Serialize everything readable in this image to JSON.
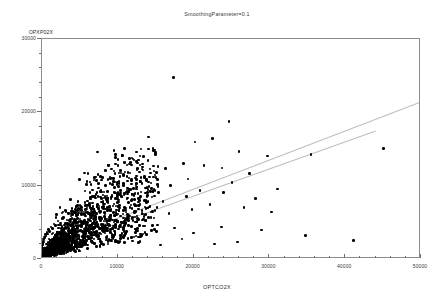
{
  "chart_data": {
    "type": "scatter",
    "title": "SmoothingParameter=0.1",
    "xlabel": "OPTCO2X",
    "ylabel": "OPXP02X",
    "xlim": [
      0,
      50000
    ],
    "ylim": [
      0,
      30000
    ],
    "xticks": [
      0,
      10000,
      20000,
      30000,
      40000,
      50000
    ],
    "xtick_labels": [
      "0",
      "10000",
      "20000",
      "30000",
      "40000",
      "50000"
    ],
    "yticks": [
      0,
      10000,
      20000,
      30000
    ],
    "ytick_labels": [
      "0",
      "10000",
      "20000",
      "30000"
    ],
    "xminor_step": 2000,
    "yminor_step": 2000,
    "grid": false,
    "legend": null,
    "marker": "filled-circle",
    "marker_color": "#000000",
    "trend_color": "#bdbdbd",
    "series": [
      {
        "name": "OPXP02X vs OPTCO2X",
        "points": [
          [
            17500,
            24600
          ],
          [
            14200,
            16500
          ],
          [
            15100,
            14300
          ],
          [
            20300,
            15800
          ],
          [
            22600,
            16300
          ],
          [
            24800,
            18600
          ],
          [
            26100,
            14500
          ],
          [
            29900,
            13900
          ],
          [
            35600,
            14100
          ],
          [
            45200,
            14900
          ],
          [
            21500,
            12600
          ],
          [
            23900,
            12300
          ],
          [
            27500,
            11500
          ],
          [
            18800,
            12900
          ],
          [
            16400,
            12200
          ],
          [
            13400,
            12800
          ],
          [
            12600,
            11200
          ],
          [
            11700,
            13600
          ],
          [
            10300,
            10400
          ],
          [
            19400,
            10800
          ],
          [
            25200,
            10300
          ],
          [
            31200,
            9400
          ],
          [
            21000,
            9200
          ],
          [
            17100,
            9900
          ],
          [
            14800,
            9100
          ],
          [
            12100,
            8700
          ],
          [
            9700,
            9600
          ],
          [
            8300,
            8200
          ],
          [
            7300,
            10600
          ],
          [
            6100,
            7800
          ],
          [
            5200,
            7100
          ],
          [
            22300,
            7300
          ],
          [
            26800,
            6900
          ],
          [
            30400,
            6300
          ],
          [
            19900,
            6600
          ],
          [
            16900,
            6100
          ],
          [
            14100,
            6800
          ],
          [
            11400,
            5900
          ],
          [
            9200,
            6400
          ],
          [
            7700,
            5600
          ],
          [
            6400,
            5200
          ],
          [
            5600,
            6000
          ],
          [
            4800,
            4900
          ],
          [
            4100,
            5400
          ],
          [
            3500,
            4200
          ],
          [
            3000,
            3800
          ],
          [
            2600,
            4500
          ],
          [
            2200,
            3200
          ],
          [
            1900,
            2800
          ],
          [
            1600,
            3400
          ],
          [
            1400,
            2400
          ],
          [
            1200,
            2000
          ],
          [
            1050,
            2600
          ],
          [
            900,
            1700
          ],
          [
            800,
            1400
          ],
          [
            700,
            1900
          ],
          [
            620,
            1200
          ],
          [
            540,
            1000
          ],
          [
            480,
            1350
          ],
          [
            420,
            860
          ],
          [
            370,
            700
          ],
          [
            330,
            950
          ],
          [
            290,
            600
          ],
          [
            255,
            480
          ],
          [
            225,
            640
          ],
          [
            200,
            400
          ],
          [
            175,
            320
          ],
          [
            155,
            430
          ],
          [
            138,
            270
          ],
          [
            122,
            215
          ],
          [
            108,
            290
          ],
          [
            96,
            180
          ],
          [
            85,
            145
          ],
          [
            75,
            195
          ],
          [
            66,
            120
          ],
          [
            59,
            98
          ],
          [
            52,
            130
          ],
          [
            46,
            82
          ],
          [
            40,
            66
          ],
          [
            36,
            88
          ],
          [
            32,
            55
          ],
          [
            28,
            44
          ],
          [
            25,
            58
          ],
          [
            22,
            37
          ],
          [
            19,
            30
          ],
          [
            17,
            39
          ],
          [
            15,
            25
          ],
          [
            13,
            20
          ],
          [
            11,
            26
          ],
          [
            10,
            17
          ],
          [
            8,
            13
          ],
          [
            7,
            18
          ],
          [
            6,
            11
          ],
          [
            5,
            9
          ],
          [
            4,
            12
          ],
          [
            3,
            7
          ],
          [
            3,
            6
          ],
          [
            2,
            8
          ],
          [
            2,
            5
          ],
          [
            1,
            4
          ],
          [
            1,
            3
          ],
          [
            23800,
            4200
          ],
          [
            29100,
            3800
          ],
          [
            34900,
            3100
          ],
          [
            41200,
            2400
          ],
          [
            20100,
            3400
          ],
          [
            17600,
            4100
          ],
          [
            15200,
            3600
          ],
          [
            13000,
            4400
          ],
          [
            10900,
            3900
          ],
          [
            8900,
            4600
          ],
          [
            7100,
            4100
          ],
          [
            5900,
            3300
          ],
          [
            4900,
            3600
          ],
          [
            4200,
            2900
          ],
          [
            3600,
            3200
          ],
          [
            3100,
            2500
          ],
          [
            2700,
            2200
          ],
          [
            2350,
            2700
          ],
          [
            2050,
            1850
          ],
          [
            1800,
            1600
          ],
          [
            1580,
            2100
          ],
          [
            1390,
            1400
          ],
          [
            1220,
            1150
          ],
          [
            1080,
            1550
          ],
          [
            950,
            980
          ],
          [
            840,
            790
          ],
          [
            740,
            1060
          ],
          [
            650,
            670
          ],
          [
            575,
            540
          ],
          [
            508,
            720
          ],
          [
            450,
            450
          ],
          [
            398,
            360
          ],
          [
            352,
            485
          ],
          [
            312,
            305
          ],
          [
            276,
            245
          ],
          [
            245,
            330
          ],
          [
            217,
            205
          ],
          [
            192,
            165
          ],
          [
            170,
            222
          ],
          [
            151,
            138
          ],
          [
            134,
            110
          ],
          [
            119,
            150
          ],
          [
            105,
            92
          ],
          [
            93,
            74
          ],
          [
            83,
            100
          ],
          [
            73,
            62
          ],
          [
            65,
            50
          ],
          [
            58,
            68
          ],
          [
            51,
            41
          ],
          [
            45,
            33
          ],
          [
            40,
            45
          ],
          [
            36,
            28
          ],
          [
            32,
            22
          ],
          [
            28,
            30
          ],
          [
            25,
            18
          ],
          [
            22,
            15
          ],
          [
            20,
            20
          ],
          [
            17,
            12
          ],
          [
            15,
            10
          ],
          [
            13,
            13
          ],
          [
            12,
            8
          ],
          [
            10,
            7
          ],
          [
            9,
            9
          ],
          [
            8,
            5
          ],
          [
            7,
            4
          ],
          [
            6,
            6
          ],
          [
            5,
            3
          ],
          [
            4,
            3
          ],
          [
            12900,
            2100
          ],
          [
            15800,
            1800
          ],
          [
            18600,
            2600
          ],
          [
            22900,
            1900
          ],
          [
            25900,
            2200
          ],
          [
            9800,
            2400
          ],
          [
            8100,
            1900
          ],
          [
            6700,
            2300
          ],
          [
            5500,
            1700
          ],
          [
            4600,
            2000
          ],
          [
            3900,
            1500
          ],
          [
            3300,
            1800
          ],
          [
            2850,
            1300
          ],
          [
            2450,
            1550
          ],
          [
            2130,
            1100
          ],
          [
            1860,
            920
          ],
          [
            1630,
            1250
          ],
          [
            1440,
            790
          ],
          [
            1270,
            650
          ],
          [
            1125,
            880
          ],
          [
            995,
            560
          ],
          [
            880,
            450
          ],
          [
            780,
            610
          ],
          [
            690,
            385
          ],
          [
            610,
            310
          ],
          [
            540,
            415
          ],
          [
            478,
            262
          ],
          [
            424,
            210
          ],
          [
            376,
            285
          ],
          [
            334,
            178
          ],
          [
            296,
            142
          ],
          [
            263,
            190
          ],
          [
            234,
            120
          ],
          [
            208,
            96
          ],
          [
            185,
            130
          ],
          [
            164,
            82
          ],
          [
            146,
            66
          ],
          [
            130,
            88
          ],
          [
            115,
            56
          ],
          [
            102,
            45
          ],
          [
            91,
            60
          ],
          [
            81,
            38
          ],
          [
            72,
            30
          ],
          [
            64,
            41
          ],
          [
            57,
            26
          ],
          [
            50,
            20
          ],
          [
            45,
            28
          ],
          [
            40,
            17
          ],
          [
            35,
            14
          ],
          [
            31,
            19
          ],
          [
            28,
            12
          ],
          [
            25,
            10
          ],
          [
            22,
            13
          ],
          [
            19,
            8
          ],
          [
            17,
            7
          ],
          [
            15,
            9
          ],
          [
            13,
            6
          ],
          [
            12,
            5
          ],
          [
            10,
            6
          ],
          [
            9,
            4
          ],
          [
            19200,
            8400
          ],
          [
            16100,
            7700
          ],
          [
            24100,
            8900
          ],
          [
            28300,
            8100
          ],
          [
            11900,
            7200
          ],
          [
            10100,
            7600
          ],
          [
            8600,
            6700
          ],
          [
            7400,
            7000
          ],
          [
            6300,
            6100
          ],
          [
            5400,
            6500
          ],
          [
            4650,
            5700
          ],
          [
            4000,
            6000
          ],
          [
            3450,
            5200
          ],
          [
            2980,
            5500
          ],
          [
            2580,
            4800
          ],
          [
            2240,
            5050
          ],
          [
            1950,
            4400
          ],
          [
            1700,
            4650
          ],
          [
            1485,
            4000
          ],
          [
            1300,
            4250
          ],
          [
            1140,
            3650
          ],
          [
            1000,
            3850
          ],
          [
            880,
            3300
          ],
          [
            775,
            3500
          ],
          [
            683,
            3000
          ],
          [
            602,
            3170
          ],
          [
            531,
            2700
          ],
          [
            469,
            2870
          ],
          [
            414,
            2450
          ],
          [
            366,
            2590
          ],
          [
            323,
            2200
          ],
          [
            286,
            2340
          ],
          [
            253,
            1990
          ],
          [
            224,
            2110
          ],
          [
            198,
            1790
          ],
          [
            175,
            1900
          ],
          [
            155,
            1610
          ],
          [
            137,
            1710
          ],
          [
            121,
            1450
          ],
          [
            107,
            1540
          ],
          [
            95,
            1300
          ],
          [
            84,
            1385
          ],
          [
            74,
            1170
          ],
          [
            66,
            1245
          ],
          [
            58,
            1050
          ],
          [
            51,
            1120
          ],
          [
            45,
            945
          ],
          [
            40,
            1005
          ],
          [
            36,
            850
          ],
          [
            32,
            905
          ],
          [
            28,
            760
          ],
          [
            25,
            810
          ],
          [
            22,
            685
          ],
          [
            20,
            730
          ],
          [
            17,
            615
          ],
          [
            15,
            655
          ],
          [
            13,
            550
          ],
          [
            12,
            585
          ],
          [
            11,
            495
          ],
          [
            10,
            525
          ]
        ]
      }
    ],
    "trend_lines": [
      {
        "name": "upper-trend",
        "x0": 450,
        "y0": 1650,
        "x1": 50000,
        "y1": 21300
      },
      {
        "name": "lower-trend",
        "x0": 450,
        "y0": 1250,
        "x1": 44200,
        "y1": 17400
      }
    ]
  }
}
